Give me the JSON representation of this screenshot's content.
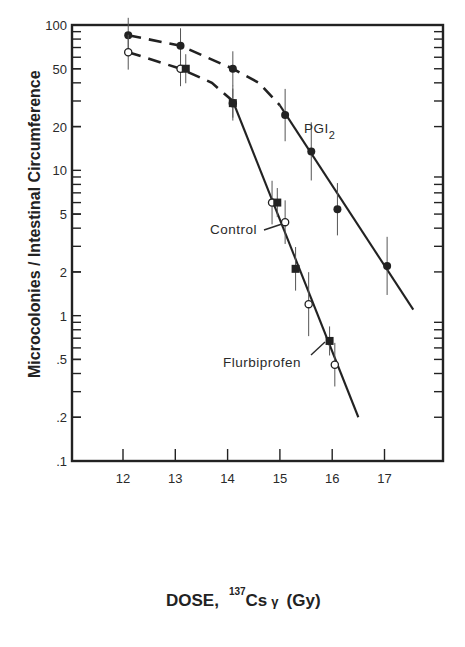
{
  "chart_data": {
    "type": "scatter",
    "title": "",
    "xlabel": "DOSE, 137Cs γ (Gy)",
    "xlabel_parts": {
      "prefix": "DOSE,",
      "superscript": "137",
      "isotope": "Cs",
      "radiation": "γ",
      "unit": "(Gy)"
    },
    "ylabel": "Microcolonies / Intestinal Circumference",
    "xlim": [
      11.0,
      18.1
    ],
    "ylim": [
      0.1,
      100
    ],
    "yscale": "log",
    "xticks": [
      12,
      13,
      14,
      15,
      16,
      17
    ],
    "xtick_labels": [
      "12",
      "13",
      "14",
      "15",
      "16",
      "17"
    ],
    "yticks": [
      100,
      50,
      20,
      10,
      5,
      2,
      1,
      0.5,
      0.2,
      0.1
    ],
    "ytick_labels": [
      "100",
      "50",
      "20",
      "10",
      "5",
      "2",
      "1",
      ".5",
      ".2",
      ".1"
    ],
    "grid": false,
    "legend": "inline labels",
    "series": [
      {
        "name": "PGI2",
        "label_main": "PGI",
        "label_sub": "2",
        "marker": "filled-circle",
        "x": [
          12.1,
          13.1,
          14.1,
          15.1,
          15.6,
          16.1,
          17.05
        ],
        "y": [
          85,
          72,
          50,
          24,
          13.5,
          5.4,
          2.2
        ],
        "err": [
          0.12,
          0.12,
          0.12,
          0.18,
          0.2,
          0.18,
          0.2
        ],
        "fit_dashed": {
          "x": [
            12.1,
            13.1,
            14.1,
            14.6,
            15.0
          ],
          "y": [
            85,
            72,
            50,
            40,
            28
          ]
        },
        "fit_solid": {
          "x": [
            15.0,
            17.55
          ],
          "y": [
            28,
            1.1
          ]
        }
      },
      {
        "name": "Control",
        "marker": "open-circle",
        "x": [
          12.1,
          13.1,
          14.1,
          14.85,
          15.1,
          15.55,
          16.05
        ],
        "y": [
          65,
          50,
          29,
          6,
          4.4,
          1.2,
          0.46
        ],
        "err": [
          0.12,
          0.12,
          0.12,
          0.15,
          0.15,
          0.22,
          0.15
        ],
        "fit_dashed": {
          "x": [
            12.1,
            13.1,
            13.7,
            14.1
          ],
          "y": [
            65,
            50,
            40,
            30
          ]
        },
        "fit_solid": {
          "x": [
            14.1,
            16.5
          ],
          "y": [
            30,
            0.2
          ]
        }
      },
      {
        "name": "Flurbiprofen",
        "marker": "filled-square",
        "x": [
          13.2,
          14.1,
          14.95,
          15.3,
          15.95
        ],
        "y": [
          50,
          29,
          6,
          2.1,
          0.67
        ],
        "err": [
          0.1,
          0.1,
          0.1,
          0.15,
          0.1
        ]
      }
    ],
    "annotations": [
      {
        "text": "Control",
        "x": 14.3,
        "y": 3.8,
        "pointer_to": [
          15.05,
          4.4
        ]
      },
      {
        "text": "Flurbiprofen",
        "x": 13.9,
        "y": 0.46,
        "pointer_to": [
          15.9,
          0.62
        ]
      },
      {
        "text": "PGI2",
        "x": 15.5,
        "y": 20
      }
    ]
  },
  "labels": {
    "control": "Control",
    "flurbiprofen": "Flurbiprofen",
    "pgi_main": "PGI",
    "pgi_sub": "2",
    "xlabel_prefix": "DOSE,",
    "xlabel_sup": "137",
    "xlabel_isotope": "Cs",
    "xlabel_gamma": "γ",
    "xlabel_unit": "(Gy)",
    "ylabel": "Microcolonies / Intestinal Circumference"
  }
}
